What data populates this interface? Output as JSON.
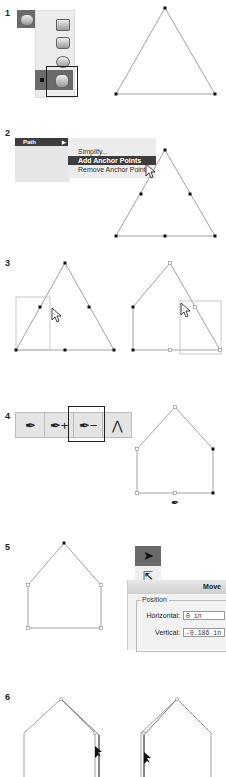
{
  "steps": [
    {
      "number": "1",
      "description": "Shape tool palette with Polygon tool selected; triangle drawn"
    },
    {
      "number": "2",
      "description": "Path menu: Add Anchor Points applied to triangle"
    },
    {
      "number": "3",
      "description": "Marquee-select and delete anchor points"
    },
    {
      "number": "4",
      "description": "Delete Anchor Point tool selected"
    },
    {
      "number": "5",
      "description": "Move dialog with Direct Selection tool"
    },
    {
      "number": "6",
      "description": "Adjusting side segments of house shape"
    }
  ],
  "step2_menu": {
    "main_item": "Path",
    "submenu": [
      "Simplify...",
      "Add Anchor Points",
      "Remove Anchor Points"
    ],
    "selected": "Add Anchor Points"
  },
  "step4_toolbar": {
    "tools": [
      "pen-tool",
      "add-anchor-point-tool",
      "delete-anchor-point-tool",
      "convert-anchor-point-tool"
    ],
    "glyphs": [
      "✒",
      "✒+",
      "✒−",
      "⋀"
    ],
    "selected": "delete-anchor-point-tool"
  },
  "step5_move_dialog": {
    "title": "Move",
    "group_label": "Position",
    "horizontal_label": "Horizontal:",
    "horizontal_value": "0 in",
    "vertical_label": "Vertical:",
    "vertical_value": "-0.186 in"
  },
  "colors": {
    "selection_dark": "#3d3d3d",
    "palette_gray": "#6a6a6a",
    "stroke": "#888888"
  }
}
